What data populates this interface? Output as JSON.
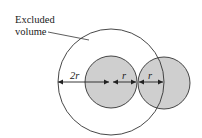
{
  "diagram": {
    "title_label": {
      "line1": "Excluded",
      "line2": "volume"
    },
    "dimensions": {
      "outer": "2r",
      "left_radius": "r",
      "right_radius": "r"
    },
    "shapes": {
      "excluded_volume_circle": {
        "cx": 111,
        "cy": 82,
        "r": 53
      },
      "sphere_a": {
        "cx": 111,
        "cy": 82,
        "r": 26,
        "fill": "#cfcfcf"
      },
      "sphere_b": {
        "cx": 164,
        "cy": 83,
        "r": 26,
        "fill": "#cfcfcf"
      }
    },
    "colors": {
      "stroke": "#333333",
      "sphere_fill": "#cfcfcf"
    }
  }
}
